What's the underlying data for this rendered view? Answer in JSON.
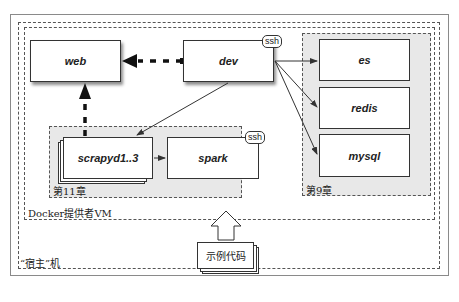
{
  "diagram": {
    "frames": {
      "host_label": "“宿主”机",
      "vm_label": "Docker提供者VM",
      "group_ch11_label": "第11章",
      "group_ch9_label": "第9章"
    },
    "nodes": {
      "web": "web",
      "dev": "dev",
      "scrapyd": "scrapyd1..3",
      "spark": "spark",
      "es": "es",
      "redis": "redis",
      "mysql": "mysql",
      "sample_code": "示例代码"
    },
    "badges": {
      "dev_ssh": "ssh",
      "spark_ssh": "ssh"
    },
    "edges": [
      {
        "from": "dev",
        "to": "web",
        "style": "thick-dashed"
      },
      {
        "from": "scrapyd",
        "to": "web",
        "style": "thick-dashed"
      },
      {
        "from": "dev",
        "to": "scrapyd",
        "style": "thin"
      },
      {
        "from": "dev",
        "to": "es",
        "style": "thin"
      },
      {
        "from": "dev",
        "to": "redis",
        "style": "thin"
      },
      {
        "from": "dev",
        "to": "mysql",
        "style": "thin"
      },
      {
        "from": "scrapyd",
        "to": "spark",
        "style": "thin"
      },
      {
        "from": "sample_code",
        "to": "vm",
        "style": "hollow-arrow"
      }
    ],
    "colors": {
      "group_fill": "#e8e8e8",
      "line": "#333333"
    }
  }
}
